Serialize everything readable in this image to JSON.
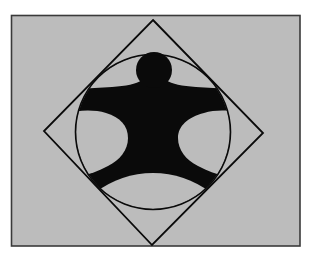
{
  "figure": {
    "colors": {
      "page_background": "#ffffff",
      "field": "#bcbcbc",
      "frame_stroke": "#3a3a3a",
      "ink": "#0a0a0a"
    },
    "frame": {
      "x": 11,
      "y": 15,
      "width": 289,
      "height": 231
    },
    "diamond": {
      "top": [
        153,
        20
      ],
      "right": [
        263,
        133
      ],
      "bottom": [
        152,
        245
      ],
      "left": [
        44,
        131
      ]
    },
    "circle": {
      "cx": 153,
      "cy": 132,
      "r": 78
    },
    "head": {
      "cx": 154,
      "cy": 70,
      "r": 18
    }
  }
}
